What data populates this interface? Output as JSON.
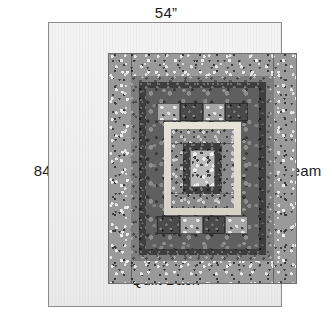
{
  "diagram": {
    "panel_label": "Quilt Back",
    "labels": {
      "width": "54”",
      "height": "84”",
      "seam": "seam"
    },
    "colors": {
      "panel_fill": "#efefef",
      "panel_border": "#8d8d8d",
      "ring_outer_speckle": "#9a9a9a",
      "ring_medium": "#7e7e7e",
      "ring_dark": "#3e3e3e",
      "ring_mid_dark": "#5f5f5f",
      "ring_print": "#8b8b8b",
      "frame_cream": "#dcd9cd",
      "center_square": "#b9b9b9",
      "tile_light": "#a5a5a5",
      "tile_dark": "#4a4a4a",
      "text": "#1b1b1b",
      "leader_line": "#5a5a5a"
    },
    "dimensions": {
      "width_inches": 54,
      "height_inches": 84,
      "unit": "inch"
    },
    "quilt_block": {
      "description": "Concentric log-cabin style rings centered on a light square",
      "rings": [
        {
          "name": "ring-1-outer-speckle",
          "fabric": "light gray speckled print"
        },
        {
          "name": "ring-2-medium",
          "fabric": "medium gray fine speckle"
        },
        {
          "name": "ring-3-dark",
          "fabric": "dark charcoal print"
        },
        {
          "name": "ring-4-mid-dark",
          "fabric": "mid-dark gray floral"
        },
        {
          "name": "ring-5-pieced-band",
          "fabric": "alternating light and dark squares"
        },
        {
          "name": "ring-6-cream-frame",
          "fabric": "cream solid sashing"
        },
        {
          "name": "ring-7-print",
          "fabric": "medium light gray print"
        },
        {
          "name": "ring-8-inner-dark",
          "fabric": "dark charcoal print"
        },
        {
          "name": "center-square",
          "fabric": "light gray speckled"
        }
      ]
    }
  }
}
